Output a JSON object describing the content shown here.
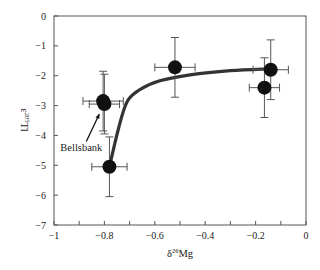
{
  "chart_data": {
    "type": "scatter",
    "title": "",
    "xlabel": "δ26Mg",
    "xlabel_base": "δ",
    "xlabel_sup": "26",
    "xlabel_tail": "Mg",
    "ylabel": "ε205Tl",
    "ylabel_base": "ε",
    "ylabel_sup": "205",
    "ylabel_tail": "Tl",
    "xlim": [
      -1,
      0
    ],
    "ylim": [
      -7,
      0
    ],
    "x_ticks": [
      -1,
      -0.8,
      -0.6,
      -0.4,
      -0.2,
      0
    ],
    "x_tick_labels": [
      "−1",
      "−0.8",
      "−0.6",
      "−0.4",
      "−0.2",
      "0"
    ],
    "x_minor_ticks": [
      -0.9,
      -0.7,
      -0.5,
      -0.3,
      -0.1
    ],
    "y_ticks": [
      0,
      -1,
      -2,
      -3,
      -4,
      -5,
      -6,
      -7
    ],
    "y_tick_labels": [
      "0",
      "−1",
      "−2",
      "−3",
      "−4",
      "−5",
      "−6",
      "−7"
    ],
    "grid": false,
    "legend": null,
    "series": [
      {
        "name": "samples",
        "marker": "filled-circle",
        "color": "#111111",
        "points": [
          {
            "x": -0.805,
            "y": -2.85,
            "xerr": 0.08,
            "yerr": 1.0
          },
          {
            "x": -0.8,
            "y": -2.95,
            "xerr": 0.06,
            "yerr": 1.0
          },
          {
            "x": -0.78,
            "y": -5.05,
            "xerr": 0.07,
            "yerr": 1.0
          },
          {
            "x": -0.52,
            "y": -1.72,
            "xerr": 0.08,
            "yerr": 1.0
          },
          {
            "x": -0.14,
            "y": -1.8,
            "xerr": 0.07,
            "yerr": 1.0
          },
          {
            "x": -0.165,
            "y": -2.4,
            "xerr": 0.06,
            "yerr": 1.0
          }
        ]
      },
      {
        "name": "mixing curve",
        "type": "line",
        "color": "#333333",
        "points": [
          {
            "x": -0.78,
            "y": -5.05
          },
          {
            "x": -0.745,
            "y": -3.8
          },
          {
            "x": -0.71,
            "y": -2.87
          },
          {
            "x": -0.66,
            "y": -2.47
          },
          {
            "x": -0.58,
            "y": -2.17
          },
          {
            "x": -0.46,
            "y": -1.97
          },
          {
            "x": -0.3,
            "y": -1.83
          },
          {
            "x": -0.14,
            "y": -1.77
          }
        ]
      }
    ],
    "annotations": [
      {
        "text": "Bellsbank",
        "x": -0.975,
        "y": -4.0,
        "arrow_to": {
          "x": -0.82,
          "y": -3.15
        }
      }
    ]
  }
}
